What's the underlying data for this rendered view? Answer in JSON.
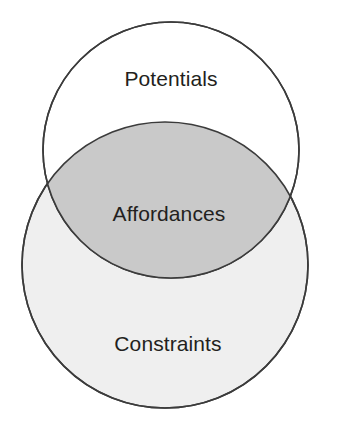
{
  "diagram": {
    "type": "venn",
    "title": "",
    "background_color": "#ffffff",
    "stroke_color": "#3b3b3b",
    "stroke_width": 1.6,
    "label_color": "#231f20",
    "sets": [
      {
        "id": "potentials",
        "label": "Potentials",
        "fill_color": "#ffffff",
        "cx": 171,
        "cy": 150,
        "r": 128,
        "label_x": 171,
        "label_y": 80
      },
      {
        "id": "constraints",
        "label": "Constraints",
        "fill_color": "#efefef",
        "cx": 165,
        "cy": 265,
        "r": 143,
        "label_x": 168,
        "label_y": 345
      }
    ],
    "intersection": {
      "id": "affordances",
      "label": "Affordances",
      "fill_color": "#c9c9c9",
      "label_x": 169,
      "label_y": 215,
      "members": [
        "potentials",
        "constraints"
      ]
    }
  }
}
